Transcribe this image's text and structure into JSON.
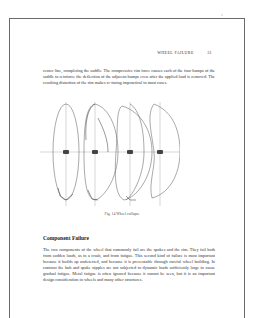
{
  "page": {
    "running_head": "WHEEL FAILURE",
    "page_number": "31",
    "paragraph_1": "center line, completing the saddle. The compressive rim force causes each of the four humps of the saddle to reinforce the deflection of the adjacent humps even after the applied load is removed. The resulting distortion of the rim makes re-truing impractical in most cases.",
    "figure": {
      "caption": "Fig. 14   Wheel collapse",
      "panels": 4,
      "description": "Four stages of a wheel rim collapsing, shown edge-on with axle hub at center and arrows indicating deflection"
    },
    "section_heading": "Component Failure",
    "paragraph_2": "The two components of the wheel that commonly fail are the spokes and the rim. They fail both from sudden loads, as in a crash, and from fatigue. This second kind of failure is most important because it builds up undetected, and because it is preventable through careful wheel building. In contrast the hub and spoke nipples are not subjected to dynamic loads sufficiently large to cause gradual fatigue. Metal fatigue is often ignored because it cannot be seen, but it is an important design consideration in wheels and many other structures."
  }
}
